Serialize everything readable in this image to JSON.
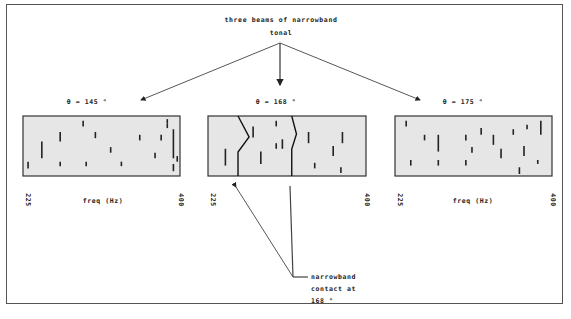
{
  "title": {
    "line1": "three beams of narrowband",
    "line2": "tonal"
  },
  "beams": [
    {
      "label": "θ = 145 °",
      "freq_start": "225",
      "freq_end": "400",
      "xlabel": "freq (Hz)",
      "lines": [
        {
          "f": 0.02,
          "t0": 0.78,
          "t1": 0.9
        },
        {
          "f": 0.11,
          "t0": 0.42,
          "t1": 0.72
        },
        {
          "f": 0.23,
          "t0": 0.25,
          "t1": 0.42
        },
        {
          "f": 0.23,
          "t0": 0.78,
          "t1": 0.86
        },
        {
          "f": 0.38,
          "t0": 0.05,
          "t1": 0.15
        },
        {
          "f": 0.4,
          "t0": 0.78,
          "t1": 0.86
        },
        {
          "f": 0.46,
          "t0": 0.25,
          "t1": 0.36
        },
        {
          "f": 0.56,
          "t0": 0.52,
          "t1": 0.62
        },
        {
          "f": 0.63,
          "t0": 0.78,
          "t1": 0.86
        },
        {
          "f": 0.75,
          "t0": 0.3,
          "t1": 0.4
        },
        {
          "f": 0.85,
          "t0": 0.62,
          "t1": 0.72
        },
        {
          "f": 0.89,
          "t0": 0.3,
          "t1": 0.4
        },
        {
          "f": 0.93,
          "t0": 0.02,
          "t1": 0.1
        },
        {
          "f": 0.97,
          "t0": 0.2,
          "t1": 0.72
        },
        {
          "f": 0.97,
          "t0": 0.82,
          "t1": 0.95
        },
        {
          "f": 0.995,
          "t0": 0.68,
          "t1": 0.78
        },
        {
          "f": 0.93,
          "t0": 0.1,
          "t1": 0.18
        }
      ]
    },
    {
      "label": "θ = 168 °",
      "freq_start": "225",
      "freq_end": "400",
      "xlabel": "",
      "tracks": [
        {
          "points": [
            [
              0.19,
              0
            ],
            [
              0.26,
              0.35
            ],
            [
              0.19,
              0.6
            ],
            [
              0.19,
              1
            ]
          ]
        },
        {
          "points": [
            [
              0.53,
              0
            ],
            [
              0.56,
              0.3
            ],
            [
              0.53,
              0.55
            ],
            [
              0.53,
              1
            ]
          ]
        }
      ],
      "lines": [
        {
          "f": 0.1,
          "t0": 0.55,
          "t1": 0.85
        },
        {
          "f": 0.28,
          "t0": 0.15,
          "t1": 0.35
        },
        {
          "f": 0.33,
          "t0": 0.6,
          "t1": 0.82
        },
        {
          "f": 0.43,
          "t0": 0.05,
          "t1": 0.15
        },
        {
          "f": 0.43,
          "t0": 0.45,
          "t1": 0.55
        },
        {
          "f": 0.47,
          "t0": 0.38,
          "t1": 0.55
        },
        {
          "f": 0.64,
          "t0": 0.25,
          "t1": 0.45
        },
        {
          "f": 0.68,
          "t0": 0.8,
          "t1": 0.9
        },
        {
          "f": 0.8,
          "t0": 0.5,
          "t1": 0.68
        },
        {
          "f": 0.86,
          "t0": 0.25,
          "t1": 0.45
        },
        {
          "f": 0.85,
          "t0": 0.88,
          "t1": 0.98
        }
      ]
    },
    {
      "label": "θ = 175 °",
      "freq_start": "225",
      "freq_end": "400",
      "xlabel": "freq (Hz)",
      "lines": [
        {
          "f": 0.06,
          "t0": 0.05,
          "t1": 0.15
        },
        {
          "f": 0.09,
          "t0": 0.75,
          "t1": 0.85
        },
        {
          "f": 0.18,
          "t0": 0.3,
          "t1": 0.4
        },
        {
          "f": 0.27,
          "t0": 0.3,
          "t1": 0.6
        },
        {
          "f": 0.27,
          "t0": 0.75,
          "t1": 0.85
        },
        {
          "f": 0.45,
          "t0": 0.3,
          "t1": 0.4
        },
        {
          "f": 0.45,
          "t0": 0.75,
          "t1": 0.85
        },
        {
          "f": 0.49,
          "t0": 0.52,
          "t1": 0.62
        },
        {
          "f": 0.55,
          "t0": 0.18,
          "t1": 0.3
        },
        {
          "f": 0.63,
          "t0": 0.3,
          "t1": 0.48
        },
        {
          "f": 0.68,
          "t0": 0.55,
          "t1": 0.72
        },
        {
          "f": 0.76,
          "t0": 0.2,
          "t1": 0.3
        },
        {
          "f": 0.8,
          "t0": 0.88,
          "t1": 1.0
        },
        {
          "f": 0.83,
          "t0": 0.5,
          "t1": 0.68
        },
        {
          "f": 0.85,
          "t0": 0.12,
          "t1": 0.2
        },
        {
          "f": 0.94,
          "t0": 0.05,
          "t1": 0.3
        },
        {
          "f": 0.92,
          "t0": 0.75,
          "t1": 0.82
        }
      ]
    }
  ],
  "annotation": {
    "line1": "narrowband",
    "line2": "contact  at",
    "line3": "168 °"
  },
  "colors": {
    "panel_fill": "#e6e6e6",
    "ink": "#222222"
  }
}
